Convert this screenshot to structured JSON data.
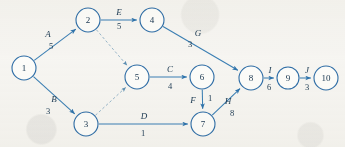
{
  "diagram": {
    "type": "activity-on-arrow network diagram",
    "background_color": "#f7f6f3",
    "node_stroke_color": "#2f6ea8",
    "edge_color": "#3a7fb5",
    "dashed_edge_color": "#8fb0c6",
    "text_color": "#1c3a53",
    "nodes": [
      {
        "id": "1",
        "label": "1",
        "x": 24,
        "y": 68,
        "r": 12
      },
      {
        "id": "2",
        "label": "2",
        "x": 88,
        "y": 20,
        "r": 12
      },
      {
        "id": "3",
        "label": "3",
        "x": 86,
        "y": 124,
        "r": 12
      },
      {
        "id": "4",
        "label": "4",
        "x": 152,
        "y": 20,
        "r": 12
      },
      {
        "id": "5",
        "label": "5",
        "x": 137,
        "y": 77,
        "r": 12
      },
      {
        "id": "6",
        "label": "6",
        "x": 202,
        "y": 77,
        "r": 12
      },
      {
        "id": "7",
        "label": "7",
        "x": 203,
        "y": 124,
        "r": 12
      },
      {
        "id": "8",
        "label": "8",
        "x": 251,
        "y": 78,
        "r": 12
      },
      {
        "id": "9",
        "label": "9",
        "x": 288,
        "y": 78,
        "r": 11
      },
      {
        "id": "10",
        "label": "10",
        "x": 326,
        "y": 78,
        "r": 12
      }
    ],
    "edges": [
      {
        "from": "1",
        "to": "2",
        "name": "A",
        "weight": "5",
        "style": "solid",
        "name_x": 48,
        "name_y": 34,
        "weight_x": 51,
        "weight_y": 46
      },
      {
        "from": "1",
        "to": "3",
        "name": "B",
        "weight": "3",
        "style": "solid",
        "name_x": 54,
        "name_y": 99,
        "weight_x": 48,
        "weight_y": 111
      },
      {
        "from": "2",
        "to": "4",
        "name": "E",
        "weight": "5",
        "style": "solid",
        "name_x": 119,
        "name_y": 12,
        "weight_x": 119,
        "weight_y": 26
      },
      {
        "from": "2",
        "to": "5",
        "name": "",
        "weight": "",
        "style": "dashed",
        "name_x": 0,
        "name_y": 0,
        "weight_x": 0,
        "weight_y": 0
      },
      {
        "from": "3",
        "to": "5",
        "name": "",
        "weight": "",
        "style": "dashed",
        "name_x": 0,
        "name_y": 0,
        "weight_x": 0,
        "weight_y": 0
      },
      {
        "from": "3",
        "to": "7",
        "name": "D",
        "weight": "1",
        "style": "solid",
        "name_x": 144,
        "name_y": 116,
        "weight_x": 143,
        "weight_y": 133
      },
      {
        "from": "4",
        "to": "8",
        "name": "G",
        "weight": "3",
        "style": "solid",
        "name_x": 198,
        "name_y": 33,
        "weight_x": 190,
        "weight_y": 44
      },
      {
        "from": "5",
        "to": "6",
        "name": "C",
        "weight": "4",
        "style": "solid",
        "name_x": 170,
        "name_y": 69,
        "weight_x": 170,
        "weight_y": 86
      },
      {
        "from": "6",
        "to": "7",
        "name": "F",
        "weight": "1",
        "style": "solid",
        "name_x": 193,
        "name_y": 100,
        "weight_x": 210,
        "weight_y": 98
      },
      {
        "from": "7",
        "to": "8",
        "name": "H",
        "weight": "8",
        "style": "solid",
        "name_x": 228,
        "name_y": 101,
        "weight_x": 232,
        "weight_y": 113
      },
      {
        "from": "8",
        "to": "9",
        "name": "I",
        "weight": "6",
        "style": "solid",
        "name_x": 270,
        "name_y": 70,
        "weight_x": 269,
        "weight_y": 87
      },
      {
        "from": "9",
        "to": "10",
        "name": "J",
        "weight": "3",
        "style": "solid",
        "name_x": 307,
        "name_y": 70,
        "weight_x": 307,
        "weight_y": 87
      }
    ]
  }
}
